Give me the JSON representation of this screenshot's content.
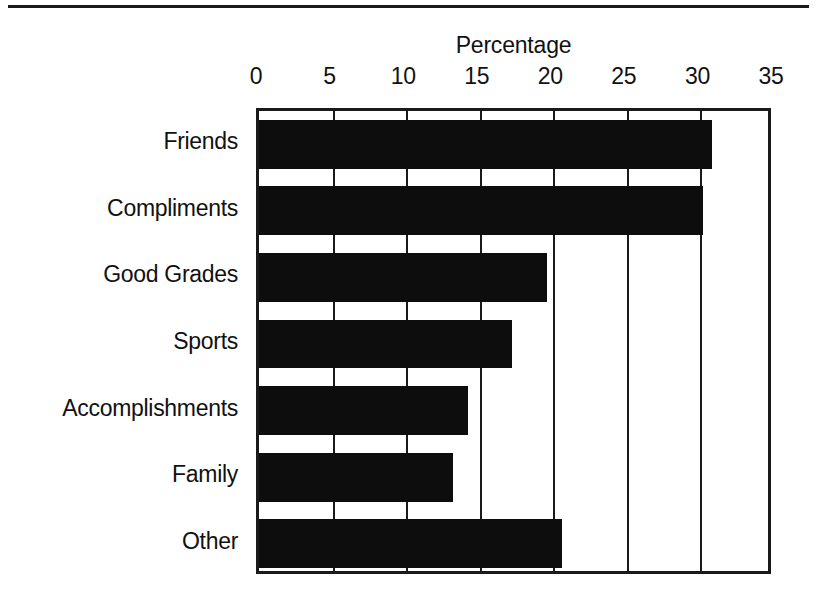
{
  "chart_data": {
    "type": "bar",
    "orientation": "horizontal",
    "title": "Percentage",
    "xlabel": "Percentage",
    "ylabel": "",
    "xlim": [
      0,
      35
    ],
    "xticks": [
      0,
      5,
      10,
      15,
      20,
      25,
      30,
      35
    ],
    "xtick_labels": [
      "0",
      "5",
      "10",
      "15",
      "20",
      "25",
      "30",
      "35"
    ],
    "grid": true,
    "grid_axis": "x",
    "legend": false,
    "bar_color": "#0d0d0d",
    "frame_color": "#1a1a1a",
    "background": "#ffffff",
    "categories": [
      "Friends",
      "Compliments",
      "Good Grades",
      "Sports",
      "Accomplishments",
      "Family",
      "Other"
    ],
    "values": [
      30.8,
      30.2,
      19.6,
      17.2,
      14.2,
      13.2,
      20.6
    ]
  }
}
